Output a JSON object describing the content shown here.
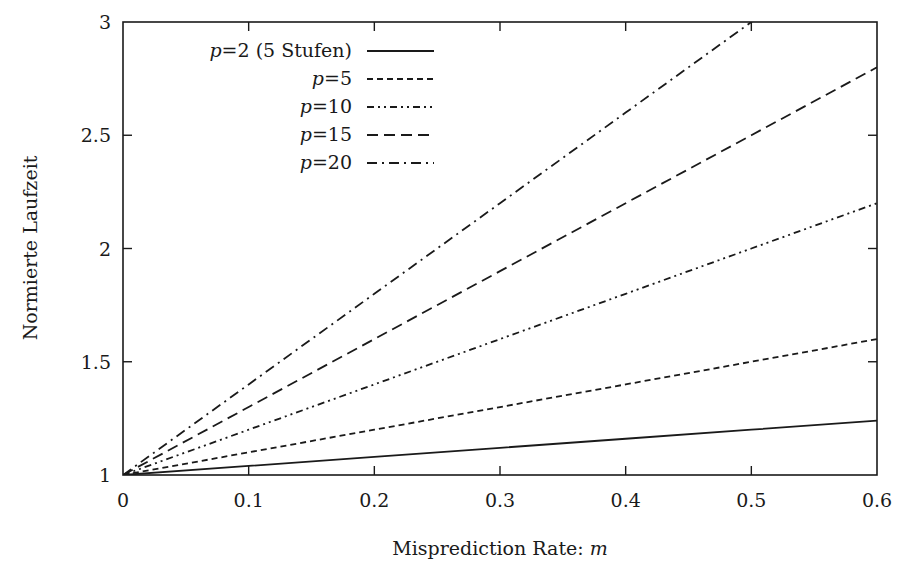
{
  "chart_data": {
    "type": "line",
    "title": "",
    "xlabel": "Misprediction Rate: m",
    "ylabel": "Normierte Laufzeit",
    "xlim": [
      0,
      0.6
    ],
    "ylim": [
      1,
      3
    ],
    "x_ticks": [
      "0",
      "0.1",
      "0.2",
      "0.3",
      "0.4",
      "0.5",
      "0.6"
    ],
    "y_ticks": [
      "1",
      "1.5",
      "2",
      "2.5",
      "3"
    ],
    "grid": false,
    "legend_position": "top-left",
    "x": [
      0,
      0.1,
      0.2,
      0.3,
      0.4,
      0.5,
      0.6
    ],
    "series": [
      {
        "name": "p=2 (5 Stufen)",
        "style": "solid",
        "values": [
          1.0,
          1.04,
          1.08,
          1.12,
          1.16,
          1.2,
          1.24
        ]
      },
      {
        "name": "p=5",
        "style": "dotted-dash",
        "values": [
          1.0,
          1.1,
          1.2,
          1.3,
          1.4,
          1.5,
          1.6
        ]
      },
      {
        "name": "p=10",
        "style": "dash-dot-dot",
        "values": [
          1.0,
          1.2,
          1.4,
          1.6,
          1.8,
          2.0,
          2.2
        ]
      },
      {
        "name": "p=15",
        "style": "dashed",
        "values": [
          1.0,
          1.3,
          1.6,
          1.9,
          2.2,
          2.5,
          2.8
        ]
      },
      {
        "name": "p=20",
        "style": "dash-dot",
        "values": [
          1.0,
          1.4,
          1.8,
          2.2,
          2.6,
          3.0,
          3.4
        ]
      }
    ]
  },
  "legend": {
    "items": [
      {
        "prefix": "p",
        "rest": "=2 (5 Stufen)"
      },
      {
        "prefix": "p",
        "rest": "=5"
      },
      {
        "prefix": "p",
        "rest": "=10"
      },
      {
        "prefix": "p",
        "rest": "=15"
      },
      {
        "prefix": "p",
        "rest": "=20"
      }
    ]
  },
  "axes": {
    "xlabel_text": "Misprediction Rate: ",
    "xlabel_var": "m",
    "ylabel": "Normierte Laufzeit"
  }
}
